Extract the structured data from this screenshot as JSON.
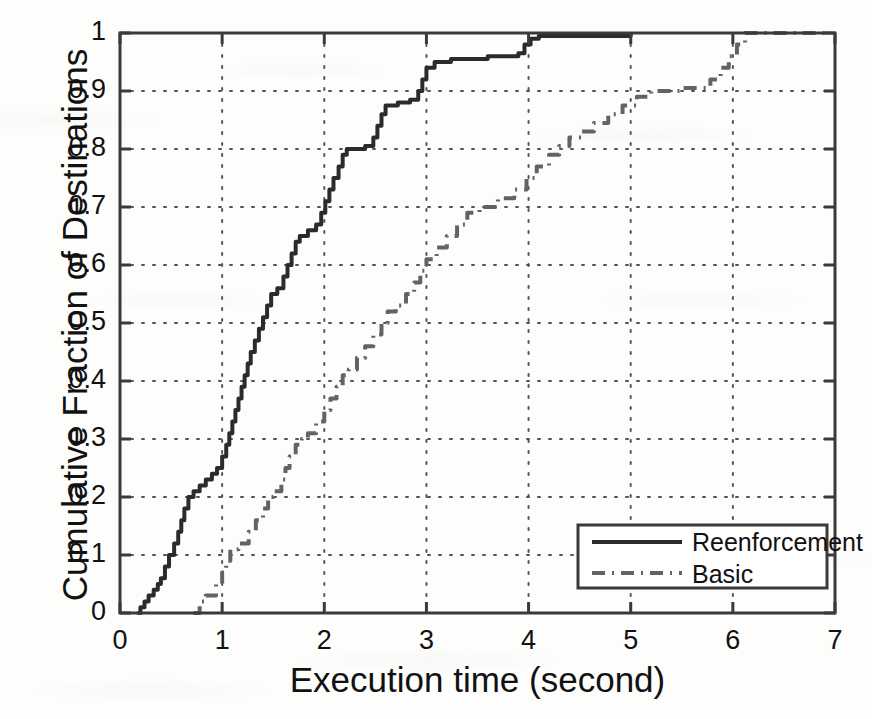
{
  "chart_data": {
    "type": "line",
    "title": "",
    "xlabel": "Execution time (second)",
    "ylabel": "Cumulative Fraction of Destinations",
    "xlim": [
      0,
      7
    ],
    "ylim": [
      0,
      1
    ],
    "xticks": [
      "0",
      "1",
      "2",
      "3",
      "4",
      "5",
      "6",
      "7"
    ],
    "xtick_values": [
      0,
      1,
      2,
      3,
      4,
      5,
      6,
      7
    ],
    "yticks": [
      "0",
      "0.1",
      "0.2",
      "0.3",
      "0.4",
      "0.5",
      "0.6",
      "0.7",
      "0.8",
      "0.9",
      "1"
    ],
    "ytick_values": [
      0,
      0.1,
      0.2,
      0.3,
      0.4,
      0.5,
      0.6,
      0.7,
      0.8,
      0.9,
      1.0
    ],
    "grid": true,
    "grid_style": "dotted",
    "legend_position": "lower right",
    "series": [
      {
        "name": "Reenforcement",
        "linestyle": "solid",
        "color": "#2b2b2b",
        "linewidth": 4,
        "points": [
          [
            0.17,
            0.0
          ],
          [
            0.2,
            0.01
          ],
          [
            0.24,
            0.02
          ],
          [
            0.28,
            0.03
          ],
          [
            0.33,
            0.04
          ],
          [
            0.37,
            0.05
          ],
          [
            0.4,
            0.06
          ],
          [
            0.44,
            0.08
          ],
          [
            0.48,
            0.1
          ],
          [
            0.53,
            0.12
          ],
          [
            0.57,
            0.14
          ],
          [
            0.6,
            0.16
          ],
          [
            0.63,
            0.18
          ],
          [
            0.67,
            0.2
          ],
          [
            0.72,
            0.21
          ],
          [
            0.78,
            0.22
          ],
          [
            0.84,
            0.23
          ],
          [
            0.9,
            0.24
          ],
          [
            0.95,
            0.25
          ],
          [
            1.0,
            0.27
          ],
          [
            1.04,
            0.29
          ],
          [
            1.07,
            0.31
          ],
          [
            1.1,
            0.33
          ],
          [
            1.13,
            0.35
          ],
          [
            1.16,
            0.37
          ],
          [
            1.19,
            0.39
          ],
          [
            1.22,
            0.41
          ],
          [
            1.25,
            0.43
          ],
          [
            1.28,
            0.45
          ],
          [
            1.32,
            0.47
          ],
          [
            1.36,
            0.49
          ],
          [
            1.4,
            0.51
          ],
          [
            1.44,
            0.53
          ],
          [
            1.48,
            0.55
          ],
          [
            1.54,
            0.56
          ],
          [
            1.6,
            0.58
          ],
          [
            1.64,
            0.6
          ],
          [
            1.68,
            0.62
          ],
          [
            1.72,
            0.64
          ],
          [
            1.76,
            0.65
          ],
          [
            1.84,
            0.66
          ],
          [
            1.92,
            0.67
          ],
          [
            1.97,
            0.69
          ],
          [
            2.01,
            0.71
          ],
          [
            2.05,
            0.73
          ],
          [
            2.09,
            0.75
          ],
          [
            2.14,
            0.77
          ],
          [
            2.18,
            0.79
          ],
          [
            2.22,
            0.8
          ],
          [
            2.4,
            0.805
          ],
          [
            2.48,
            0.82
          ],
          [
            2.52,
            0.84
          ],
          [
            2.56,
            0.86
          ],
          [
            2.6,
            0.875
          ],
          [
            2.72,
            0.88
          ],
          [
            2.84,
            0.885
          ],
          [
            2.92,
            0.9
          ],
          [
            2.96,
            0.92
          ],
          [
            3.0,
            0.94
          ],
          [
            3.08,
            0.95
          ],
          [
            3.24,
            0.955
          ],
          [
            3.6,
            0.96
          ],
          [
            3.9,
            0.965
          ],
          [
            3.96,
            0.98
          ],
          [
            4.02,
            0.99
          ],
          [
            4.1,
            0.995
          ],
          [
            5.0,
            1.0
          ]
        ]
      },
      {
        "name": "Basic",
        "linestyle": "dashdot",
        "color": "#636363",
        "linewidth": 4,
        "points": [
          [
            0.72,
            0.0
          ],
          [
            0.78,
            0.02
          ],
          [
            0.84,
            0.03
          ],
          [
            0.94,
            0.05
          ],
          [
            1.0,
            0.07
          ],
          [
            1.04,
            0.09
          ],
          [
            1.08,
            0.11
          ],
          [
            1.16,
            0.12
          ],
          [
            1.26,
            0.14
          ],
          [
            1.33,
            0.16
          ],
          [
            1.4,
            0.18
          ],
          [
            1.45,
            0.2
          ],
          [
            1.5,
            0.21
          ],
          [
            1.58,
            0.23
          ],
          [
            1.62,
            0.25
          ],
          [
            1.66,
            0.27
          ],
          [
            1.72,
            0.29
          ],
          [
            1.78,
            0.3
          ],
          [
            1.84,
            0.31
          ],
          [
            1.92,
            0.33
          ],
          [
            2.0,
            0.35
          ],
          [
            2.06,
            0.37
          ],
          [
            2.12,
            0.39
          ],
          [
            2.18,
            0.41
          ],
          [
            2.24,
            0.42
          ],
          [
            2.32,
            0.44
          ],
          [
            2.4,
            0.46
          ],
          [
            2.48,
            0.48
          ],
          [
            2.56,
            0.5
          ],
          [
            2.62,
            0.52
          ],
          [
            2.7,
            0.53
          ],
          [
            2.8,
            0.55
          ],
          [
            2.88,
            0.57
          ],
          [
            2.94,
            0.59
          ],
          [
            3.0,
            0.61
          ],
          [
            3.1,
            0.63
          ],
          [
            3.2,
            0.65
          ],
          [
            3.3,
            0.67
          ],
          [
            3.4,
            0.69
          ],
          [
            3.52,
            0.7
          ],
          [
            3.7,
            0.715
          ],
          [
            3.86,
            0.73
          ],
          [
            3.98,
            0.75
          ],
          [
            4.08,
            0.77
          ],
          [
            4.2,
            0.79
          ],
          [
            4.3,
            0.805
          ],
          [
            4.4,
            0.82
          ],
          [
            4.52,
            0.83
          ],
          [
            4.64,
            0.845
          ],
          [
            4.78,
            0.86
          ],
          [
            4.92,
            0.875
          ],
          [
            5.06,
            0.89
          ],
          [
            5.2,
            0.9
          ],
          [
            5.5,
            0.905
          ],
          [
            5.78,
            0.92
          ],
          [
            5.88,
            0.94
          ],
          [
            5.96,
            0.96
          ],
          [
            6.04,
            0.98
          ],
          [
            6.12,
            1.0
          ],
          [
            6.9,
            1.0
          ]
        ]
      }
    ]
  },
  "legend": {
    "items": [
      {
        "label": "Reenforcement",
        "style": "solid"
      },
      {
        "label": "Basic",
        "style": "dashdot"
      }
    ]
  },
  "colors": {
    "reenforcement": "#2b2b2b",
    "basic": "#636363",
    "axis": "#3a3a3a",
    "grid": "#555555",
    "background": "#fdfdfc"
  }
}
